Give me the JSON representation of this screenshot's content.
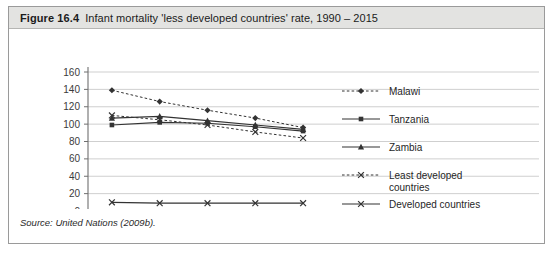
{
  "figure": {
    "number": "Figure 16.4",
    "caption": "Infant mortality 'less developed countries' rate, 1990 – 2015",
    "source": "Source: United Nations (2009b)."
  },
  "chart_data": {
    "type": "line",
    "title": "Infant mortality 'less developed countries' rate, 1990 – 2015",
    "xlabel": "",
    "ylabel": "",
    "categories": [
      "1990–\n1995",
      "1995–\n2000",
      "2000–\n2005",
      "2005–\n2010",
      "2010–\n2015"
    ],
    "category_lines": [
      [
        "1990 –",
        "1995"
      ],
      [
        "1995 –",
        "2000"
      ],
      [
        "2000 –",
        "2005"
      ],
      [
        "2005 –",
        "2010"
      ],
      [
        "2010 –",
        "2015"
      ]
    ],
    "ylim": [
      0,
      160
    ],
    "yticks": [
      0,
      20,
      40,
      60,
      80,
      100,
      120,
      140,
      160
    ],
    "grid": true,
    "legend_position": "right",
    "series": [
      {
        "name": "Malawi",
        "values": [
          139,
          126,
          116,
          107,
          96
        ],
        "style": "dotted",
        "marker": "diamond",
        "color": "#333333"
      },
      {
        "name": "Tanzania",
        "values": [
          99,
          102,
          101,
          97,
          92
        ],
        "style": "solid",
        "marker": "square",
        "color": "#333333"
      },
      {
        "name": "Zambia",
        "values": [
          107,
          109,
          104,
          99,
          94
        ],
        "style": "solid",
        "marker": "triangle",
        "color": "#333333"
      },
      {
        "name": "Least developed countries",
        "values": [
          110,
          105,
          99,
          91,
          84
        ],
        "style": "dotted",
        "marker": "cross",
        "color": "#333333"
      },
      {
        "name": "Developed countries",
        "values": [
          10,
          9,
          9,
          9,
          9
        ],
        "style": "solid",
        "marker": "cross",
        "color": "#333333"
      }
    ]
  },
  "colors": {
    "header_bg": "#e3e3e1",
    "border": "#9a9a9a",
    "grid": "#c9c9c9",
    "axis": "#6f6f6f",
    "ink": "#333333"
  }
}
